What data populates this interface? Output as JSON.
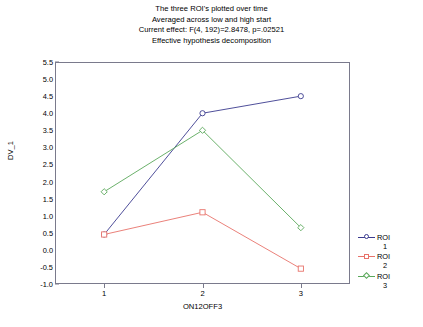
{
  "chart_data": {
    "type": "line",
    "title": "The three ROI's plotted over time",
    "title_lines": [
      "The three ROI's plotted over time",
      "Averaged across low and high start",
      "Current effect: F(4, 192)=2.8478, p=.02521",
      "Effective hypothesis decomposition"
    ],
    "xlabel": "ON12OFF3",
    "ylabel": "DV_1",
    "categories": [
      "1",
      "2",
      "3"
    ],
    "x": [
      1,
      2,
      3
    ],
    "xlim": [
      0.5,
      3.5
    ],
    "ylim": [
      -1.0,
      5.5
    ],
    "yticks": [
      "5.5",
      "5.0",
      "4.5",
      "4.0",
      "3.5",
      "3.0",
      "2.5",
      "2.0",
      "1.5",
      "1.0",
      "0.5",
      "0.0",
      "-0.5",
      "-1.0"
    ],
    "ytick_values": [
      5.5,
      5.0,
      4.5,
      4.0,
      3.5,
      3.0,
      2.5,
      2.0,
      1.5,
      1.0,
      0.5,
      0.0,
      -0.5,
      -1.0
    ],
    "grid": false,
    "legend_position": "right",
    "series": [
      {
        "name": "ROI",
        "name_line2": "1",
        "values": [
          0.45,
          4.0,
          4.5
        ],
        "color": "#3b3b8f",
        "marker": "circle"
      },
      {
        "name": "ROI",
        "name_line2": "2",
        "values": [
          0.45,
          1.1,
          -0.55
        ],
        "color": "#e8736b",
        "marker": "square"
      },
      {
        "name": "ROI",
        "name_line2": "3",
        "values": [
          1.7,
          3.5,
          0.65
        ],
        "color": "#5aa85a",
        "marker": "diamond"
      }
    ]
  },
  "colors": {
    "axis": "#7a7a8c",
    "text": "#000000",
    "background": "#ffffff",
    "series_1": "#3b3b8f",
    "series_2": "#e8736b",
    "series_3": "#5aa85a"
  }
}
